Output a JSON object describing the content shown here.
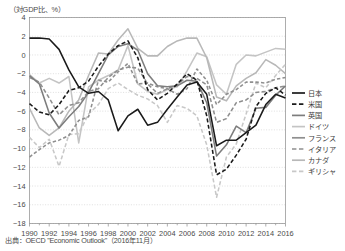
{
  "axis_unit_label": "（対GDP比、%）",
  "source_note": "出典：OECD \"Economic Outlook\"（2016年11月）",
  "legend": {
    "items": [
      {
        "label": "日本",
        "color": "#1a1a1a",
        "style": "solid",
        "width": 1.7
      },
      {
        "label": "米国",
        "color": "#1a1a1a",
        "style": "dashed",
        "width": 1.7
      },
      {
        "label": "英国",
        "color": "#7d7d7d",
        "style": "solid",
        "width": 1.7
      },
      {
        "label": "ドイツ",
        "color": "#c4c4c4",
        "style": "solid",
        "width": 1.7
      },
      {
        "label": "フランス",
        "color": "#8f8f8f",
        "style": "solid",
        "width": 1.7
      },
      {
        "label": "イタリア",
        "color": "#8f8f8f",
        "style": "dashed",
        "width": 1.7
      },
      {
        "label": "カナダ",
        "color": "#b8b8b8",
        "style": "solid",
        "width": 1.7
      },
      {
        "label": "ギリシャ",
        "color": "#c8c8c8",
        "style": "dashed",
        "width": 1.7
      }
    ]
  },
  "chart_data": {
    "type": "line",
    "title": "",
    "xlabel": "",
    "ylabel": "（対GDP比、%）",
    "xlim": [
      1990,
      2016
    ],
    "ylim": [
      -18,
      4
    ],
    "ytick_step": 2,
    "yticks": [
      4,
      2,
      0,
      -2,
      -4,
      -6,
      -8,
      -10,
      -12,
      -14,
      -16,
      -18
    ],
    "xticks": [
      1990,
      1992,
      1994,
      1996,
      1998,
      2000,
      2002,
      2004,
      2006,
      2008,
      2010,
      2012,
      2014,
      2016
    ],
    "xtick_minor_step": 1,
    "grid": true,
    "legend_position": "right",
    "x": [
      1990,
      1991,
      1992,
      1993,
      1994,
      1995,
      1996,
      1997,
      1998,
      1999,
      2000,
      2001,
      2002,
      2003,
      2004,
      2005,
      2006,
      2007,
      2008,
      2009,
      2010,
      2011,
      2012,
      2013,
      2014,
      2015,
      2016
    ],
    "series": [
      {
        "name": "日本",
        "values": [
          1.8,
          1.8,
          1.7,
          0.6,
          -1.6,
          -3.4,
          -4.1,
          -3.9,
          -4.8,
          -8.1,
          -6.5,
          -5.8,
          -7.5,
          -7.2,
          -5.8,
          -4.5,
          -3.2,
          -2.9,
          -4.2,
          -9.7,
          -9.1,
          -9.1,
          -8.3,
          -7.5,
          -5.3,
          -4.2,
          -4.6
        ],
        "color": "#1a1a1a",
        "style": "solid"
      },
      {
        "name": "米国",
        "values": [
          -5.2,
          -6.1,
          -6.4,
          -5.3,
          -3.8,
          -3.5,
          -2.8,
          -1.2,
          0.1,
          1.0,
          1.5,
          -0.3,
          -3.7,
          -4.8,
          -4.1,
          -3.1,
          -2.0,
          -2.7,
          -6.5,
          -12.8,
          -12.2,
          -10.7,
          -9.0,
          -5.5,
          -4.1,
          -3.5,
          -4.3
        ],
        "color": "#1a1a1a",
        "style": "dashed"
      },
      {
        "name": "英国",
        "values": [
          -2.2,
          -3.1,
          -6.2,
          -7.8,
          -6.6,
          -5.5,
          -4.0,
          -2.0,
          0.0,
          0.9,
          1.2,
          0.5,
          -2.0,
          -3.3,
          -3.4,
          -3.3,
          -2.7,
          -2.8,
          -5.1,
          -10.8,
          -9.6,
          -7.6,
          -8.3,
          -5.7,
          -5.6,
          -4.3,
          -3.3
        ],
        "color": "#7d7d7d",
        "style": "solid"
      },
      {
        "name": "ドイツ",
        "values": [
          -2.1,
          -3.0,
          -2.5,
          -3.0,
          -2.3,
          -9.4,
          -3.4,
          -2.7,
          -2.2,
          -1.6,
          1.0,
          -3.1,
          -3.9,
          -4.2,
          -3.7,
          -3.4,
          -1.7,
          0.2,
          -0.2,
          -3.2,
          -4.2,
          -1.0,
          0.0,
          -0.1,
          0.3,
          0.7,
          0.6
        ],
        "color": "#c4c4c4",
        "style": "solid"
      },
      {
        "name": "フランス",
        "values": [
          -2.4,
          -2.9,
          -4.6,
          -6.4,
          -5.4,
          -5.1,
          -3.9,
          -3.6,
          -2.4,
          -1.6,
          -1.3,
          -1.4,
          -3.1,
          -4.1,
          -3.6,
          -3.2,
          -2.3,
          -2.5,
          -3.2,
          -7.2,
          -6.8,
          -5.1,
          -4.8,
          -4.0,
          -3.9,
          -3.5,
          -3.3
        ],
        "color": "#8f8f8f",
        "style": "dashed"
      },
      {
        "name": "イタリア",
        "values": [
          -10.9,
          -10.1,
          -9.4,
          -9.1,
          -8.6,
          -7.0,
          -6.6,
          -2.7,
          -2.9,
          -1.8,
          -0.9,
          -3.1,
          -3.0,
          -3.4,
          -3.6,
          -4.2,
          -3.6,
          -1.5,
          -2.7,
          -5.3,
          -4.2,
          -3.7,
          -2.9,
          -2.9,
          -3.0,
          -2.6,
          -2.4
        ],
        "color": "#8f8f8f",
        "style": "dashed2"
      },
      {
        "name": "カナダ",
        "values": [
          -5.7,
          -7.8,
          -8.6,
          -7.8,
          -6.0,
          -4.8,
          -2.2,
          0.2,
          0.1,
          1.6,
          2.8,
          0.7,
          -0.1,
          -0.1,
          0.9,
          1.5,
          1.8,
          1.8,
          -0.3,
          -4.5,
          -4.9,
          -3.3,
          -2.5,
          -1.9,
          -0.5,
          -1.1,
          -2.0
        ],
        "color": "#b8b8b8",
        "style": "solid"
      },
      {
        "name": "ギリシャ",
        "values": [
          -8.8,
          -9.9,
          -9.0,
          -11.9,
          -8.5,
          -8.4,
          -6.3,
          -5.3,
          -3.6,
          -3.0,
          -3.7,
          -4.3,
          -4.7,
          -5.4,
          -7.2,
          -5.4,
          -5.7,
          -6.5,
          -9.6,
          -15.2,
          -10.9,
          -9.5,
          -6.3,
          -3.0,
          -3.5,
          -2.2,
          -1.0
        ],
        "color": "#c8c8c8",
        "style": "dashed"
      }
    ]
  }
}
